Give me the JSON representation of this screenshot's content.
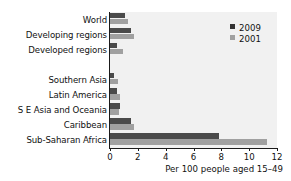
{
  "chart_data": {
    "type": "bar",
    "orientation": "horizontal",
    "title": "",
    "xlabel": "Per 100 people aged 15–49",
    "ylabel": "",
    "xlim": [
      0,
      12
    ],
    "xticks": [
      0,
      2,
      4,
      6,
      8,
      10,
      12
    ],
    "grid": false,
    "legend_position": "top-right",
    "categories": [
      "World",
      "Developing regions",
      "Developed regions",
      "",
      "Southern Asia",
      "Latin America",
      "S E Asia and Oceania",
      "Caribbean",
      "Sub-Saharan Africa"
    ],
    "series": [
      {
        "name": "2009",
        "color": "#4a4a4a",
        "values": [
          1.1,
          1.5,
          0.5,
          null,
          0.3,
          0.5,
          0.7,
          1.5,
          7.8
        ]
      },
      {
        "name": "2001",
        "color": "#a0a0a0",
        "values": [
          1.3,
          1.75,
          0.9,
          null,
          0.55,
          0.7,
          0.65,
          1.7,
          11.3
        ]
      }
    ]
  },
  "legend": {
    "items": [
      {
        "label": "2009",
        "swatch_class": "s2009"
      },
      {
        "label": "2001",
        "swatch_class": "s2001"
      }
    ]
  },
  "colors": {
    "series_2009": "#4a4a4a",
    "series_2001": "#a0a0a0",
    "plot_background": "#f1f1f1",
    "axis": "#1a1a1a",
    "text": "#111111"
  }
}
